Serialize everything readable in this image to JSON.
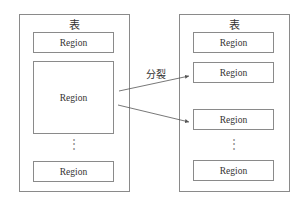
{
  "left_table": {
    "title": "表",
    "regions": [
      "Region",
      "Region",
      "Region"
    ],
    "ellipsis": "⋮"
  },
  "right_table": {
    "title": "表",
    "regions": [
      "Region",
      "Region",
      "Region",
      "Region"
    ],
    "ellipsis": "⋮"
  },
  "arrow_label": "分裂",
  "colors": {
    "stroke": "#8a8a8a",
    "text": "#333333",
    "arrow": "#555555"
  }
}
